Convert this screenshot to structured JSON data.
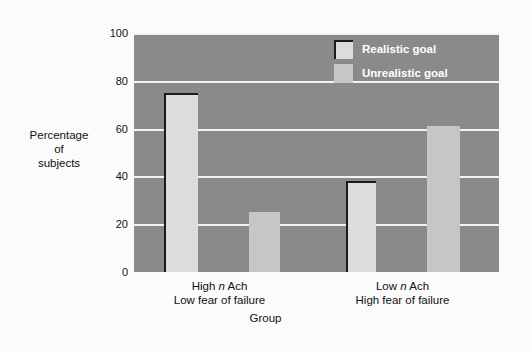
{
  "chart_data": {
    "type": "bar",
    "title": "",
    "xlabel": "Group",
    "ylabel": "Percentage\nof\nsubjects",
    "ylabel_lines": [
      "Percentage",
      "of",
      "subjects"
    ],
    "categories": [
      "High n Ach\nLow fear of failure",
      "Low n Ach\nHigh fear of failure"
    ],
    "category_lines": [
      {
        "line1_pre": "High ",
        "line1_italic": "n",
        "line1_post": " Ach",
        "line2": "Low fear of failure"
      },
      {
        "line1_pre": "Low ",
        "line1_italic": "n",
        "line1_post": " Ach",
        "line2": "High fear of failure"
      }
    ],
    "series": [
      {
        "name": "Realistic goal",
        "values": [
          75,
          38
        ],
        "color": "#dcdcdc"
      },
      {
        "name": "Unrealistic goal",
        "values": [
          25,
          61
        ],
        "color": "#c6c6c6"
      }
    ],
    "ylim": [
      0,
      100
    ],
    "yticks": [
      0,
      20,
      40,
      60,
      80,
      100
    ],
    "ytick_labels": [
      "0",
      "20",
      "40",
      "60",
      "80",
      "100"
    ],
    "grid": true,
    "legend_position": "top-right",
    "plot_background": "#8a8a8a",
    "gridline_color": "#f2f2f2"
  },
  "bars": [
    {
      "name": "bar-high-nach-realistic",
      "group": 0,
      "series": 0,
      "value": 75,
      "left": 30,
      "width": 34
    },
    {
      "name": "bar-high-nach-unrealistic",
      "group": 0,
      "series": 1,
      "value": 25,
      "left": 115,
      "width": 31
    },
    {
      "name": "bar-low-nach-realistic",
      "group": 1,
      "series": 0,
      "value": 38,
      "left": 212,
      "width": 30
    },
    {
      "name": "bar-low-nach-unrealistic",
      "group": 1,
      "series": 1,
      "value": 61,
      "left": 293,
      "width": 33
    }
  ],
  "axis": {
    "y_title_line1": "Percentage",
    "y_title_line2": "of",
    "y_title_line3": "subjects",
    "x_title": "Group",
    "tick_100": "100",
    "tick_80": "80",
    "tick_60": "60",
    "tick_40": "40",
    "tick_20": "20",
    "tick_0": "0"
  },
  "categories_text": {
    "group1_line1_pre": "High ",
    "group1_line1_italic": "n",
    "group1_line1_post": " Ach",
    "group1_line2": "Low fear of failure",
    "group2_line1_pre": "Low ",
    "group2_line1_italic": "n",
    "group2_line1_post": " Ach",
    "group2_line2": "High fear of failure"
  },
  "legend": {
    "items": [
      {
        "label": "Realistic goal",
        "swatch": "realistic"
      },
      {
        "label": "Unrealistic goal",
        "swatch": "unrealistic"
      }
    ],
    "realistic_label": "Realistic goal",
    "unrealistic_label": "Unrealistic goal"
  }
}
